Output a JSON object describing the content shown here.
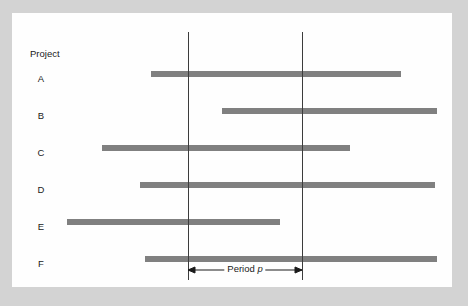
{
  "chart_data": {
    "type": "bar",
    "title": "",
    "xlabel": "",
    "ylabel": "Project",
    "orientation": "horizontal",
    "grid": false,
    "legend": false,
    "axis_title": "Project",
    "categories": [
      "A",
      "B",
      "C",
      "D",
      "E",
      "F"
    ],
    "bars": [
      {
        "category": "A",
        "start": 151,
        "end": 401
      },
      {
        "category": "B",
        "start": 222,
        "end": 437
      },
      {
        "category": "C",
        "start": 102,
        "end": 350
      },
      {
        "category": "D",
        "start": 140,
        "end": 435
      },
      {
        "category": "E",
        "start": 67,
        "end": 280
      },
      {
        "category": "F",
        "start": 145,
        "end": 437
      }
    ],
    "reference_lines": [
      {
        "name": "period-start",
        "x": 188
      },
      {
        "name": "period-end",
        "x": 302
      }
    ],
    "annotation": {
      "label_prefix": "Period ",
      "label_symbol": "p",
      "from_x": 188,
      "to_x": 302
    },
    "colors": {
      "bar": "#808080",
      "reference_line": "#3c3c3c",
      "canvas": "#fefefe",
      "frame": "#d3d3d3",
      "text": "#1a1a1a"
    }
  }
}
